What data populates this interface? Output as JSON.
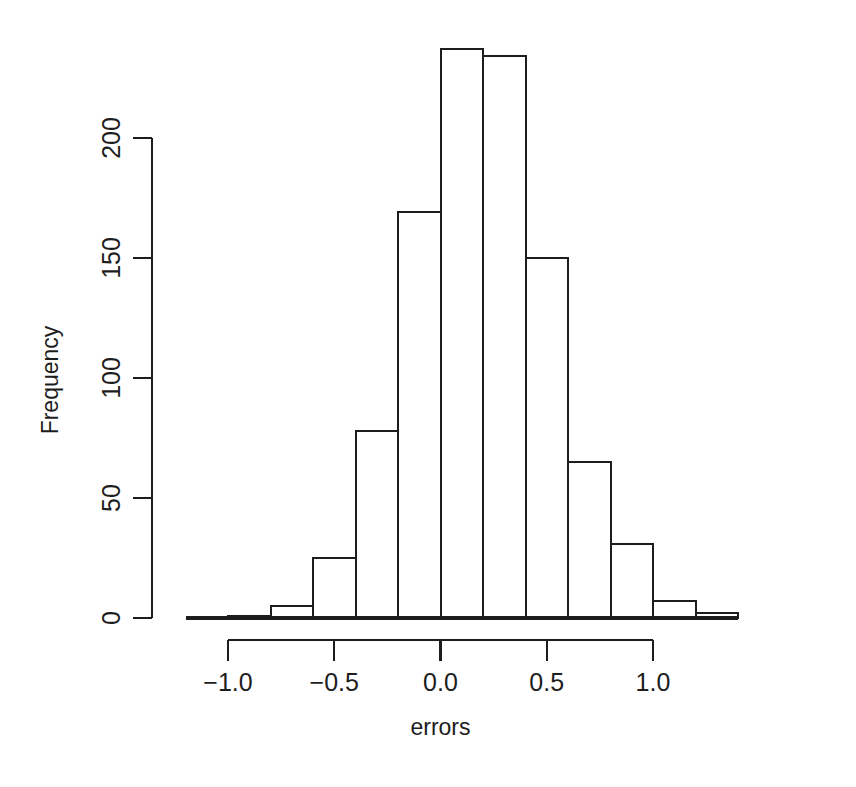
{
  "chart_data": {
    "type": "bar",
    "subtype": "histogram",
    "title": "",
    "xlabel": "errors",
    "ylabel": "Frequency",
    "xlim": [
      -1.12,
      1.3
    ],
    "ylim": [
      0,
      245
    ],
    "grid": false,
    "legend": null,
    "bin_width": 0.2,
    "bin_edges": [
      -1.2,
      -1.0,
      -0.8,
      -0.6,
      -0.4,
      -0.2,
      0.0,
      0.2,
      0.4,
      0.6,
      0.8,
      1.0,
      1.2
    ],
    "categories": [
      "-1.2–-1.0",
      "-1.0–-0.8",
      "-0.8–-0.6",
      "-0.6–-0.4",
      "-0.4–-0.2",
      "-0.2–0.0",
      "0.0–0.2",
      "0.2–0.4",
      "0.4–0.6",
      "0.6–0.8",
      "0.8–1.0",
      "1.0–1.2"
    ],
    "values": [
      0,
      1,
      5,
      25,
      78,
      169,
      237,
      234,
      150,
      65,
      31,
      7
    ],
    "extra_bin": {
      "edges": [
        1.2,
        1.4
      ],
      "value": 2
    },
    "xticks": [
      -1.0,
      -0.5,
      0.0,
      0.5,
      1.0
    ],
    "xtick_labels": [
      "-1.0",
      "-0.5",
      "0.0",
      "0.5",
      "1.0"
    ],
    "yticks": [
      0,
      50,
      100,
      150,
      200
    ],
    "ytick_labels": [
      "0",
      "50",
      "100",
      "150",
      "200"
    ],
    "colors": {
      "bar_fill": "#ffffff",
      "bar_stroke": "#1d1d1d",
      "axis": "#1d1d1d",
      "background": "#ffffff",
      "text": "#1d1d1d"
    }
  }
}
